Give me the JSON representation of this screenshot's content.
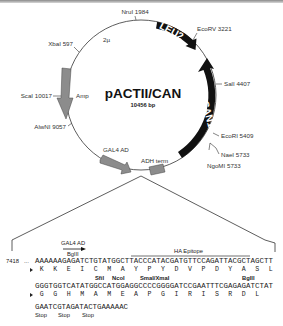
{
  "plasmid": {
    "name": "pACTII/CAN",
    "size": "10456 bp"
  },
  "features": [
    {
      "name": "LEU2",
      "type": "gene",
      "color": "#111111"
    },
    {
      "name": "CAN1",
      "type": "gene",
      "color": "#111111"
    },
    {
      "name": "Amp",
      "type": "gene",
      "color": "#888888"
    },
    {
      "name": "GAL4 AD",
      "type": "gene",
      "color": "#888888"
    },
    {
      "name": "ADH term",
      "type": "terminator",
      "color": "#888888"
    },
    {
      "name": "2µ",
      "type": "origin"
    }
  ],
  "sites": [
    {
      "label": "NruI 1984"
    },
    {
      "label": "EcoRV 3221"
    },
    {
      "label": "SalI 4407"
    },
    {
      "label": "EcoRI 5409"
    },
    {
      "label": "NaeI 5733"
    },
    {
      "label": "NgoMI 5733"
    },
    {
      "label": "XbaI 597"
    },
    {
      "label": "ScaI 10017"
    },
    {
      "label": "AlwNI 9057"
    }
  ],
  "insert": {
    "gal4_label": "GAL4 AD",
    "bglii_top": "BglII",
    "ha_label": "HA Epitope",
    "line1": {
      "position": "7418",
      "prefix": "...",
      "seq": "AAAAAAGAGATCTGTATGGCTTACCCATACGATGTTCCAGATTACGCTAGCTT",
      "aa": [
        "K",
        "K",
        "E",
        "I",
        "C",
        "M",
        "A",
        "Y",
        "P",
        "Y",
        "D",
        "V",
        "P",
        "D",
        "Y",
        "A",
        "S",
        "L"
      ]
    },
    "sites_line2": {
      "sfil": "SfiI",
      "ncoi": "NcoI",
      "smai": "SmaI/XmaI",
      "bglii": "BglII"
    },
    "line2": {
      "seq": "GGGTGGTCATATGGCCATGGAGGCCCCGGGGATCCGAATTTCGAGAGATCTAT",
      "aa": [
        "G",
        "G",
        "H",
        "M",
        "A",
        "M",
        "E",
        "A",
        "P",
        "G",
        "I",
        "R",
        "I",
        "S",
        "R",
        "D",
        "L"
      ]
    },
    "line3": {
      "seq": "GAATCGTAGATACTGAAAAAC",
      "stops": [
        "Stop",
        "Stop",
        "Stop"
      ]
    }
  }
}
